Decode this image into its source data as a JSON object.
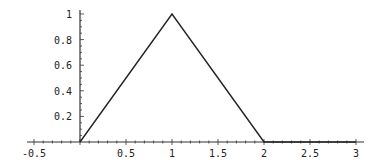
{
  "chart_data": {
    "type": "line",
    "title": "",
    "xlabel": "",
    "ylabel": "",
    "xlim": [
      -0.5,
      3.1
    ],
    "ylim": [
      0,
      1
    ],
    "grid": false,
    "legend": null,
    "x_ticks": [
      -0.5,
      0.5,
      1,
      1.5,
      2,
      2.5,
      3
    ],
    "x_tick_labels": [
      "-0.5",
      "0.5",
      "1",
      "1.5",
      "2",
      "2.5",
      "3"
    ],
    "y_ticks": [
      0.2,
      0.4,
      0.6,
      0.8,
      1
    ],
    "y_tick_labels": [
      "0.2",
      "0.4",
      "0.6",
      "0.8",
      "1"
    ],
    "series": [
      {
        "name": "triangle",
        "x": [
          0,
          1,
          2,
          3
        ],
        "y": [
          0,
          1,
          0,
          0
        ],
        "color": "#222222"
      }
    ]
  },
  "layout": {
    "origin_px": [
      80,
      142
    ],
    "x_unit_px": 92,
    "y_unit_px": 128,
    "x_axis_range_px": [
      27,
      364
    ],
    "y_axis_range_px": [
      142,
      10
    ],
    "axis_color": "#333333",
    "line_color": "#222222"
  }
}
